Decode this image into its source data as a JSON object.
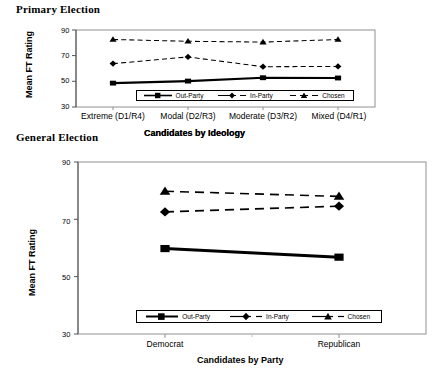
{
  "figure": {
    "panels": [
      {
        "id": "primary",
        "title": "Primary Election",
        "ylabel": "Mean FT Rating",
        "xlabel": "Candidates by Ideology"
      },
      {
        "id": "general",
        "title": "General Election",
        "ylabel": "Mean FT Rating",
        "xlabel": "Candidates by Party"
      }
    ],
    "legend": {
      "entries": [
        {
          "label": "Out-Party",
          "marker": "square",
          "line": "solid"
        },
        {
          "label": "In-Party",
          "marker": "diamond",
          "line": "dash-dot"
        },
        {
          "label": "Chosen",
          "marker": "triangle",
          "line": "dash-dot"
        }
      ]
    },
    "colors": {
      "line": "#000000",
      "frame": "#808080",
      "background": "#ffffff"
    }
  },
  "chart_data": [
    {
      "type": "line",
      "title": "Primary Election",
      "xlabel": "Candidates by Ideology",
      "ylabel": "Mean FT Rating",
      "categories": [
        "Extreme (D1/R4)",
        "Modal (D2/R3)",
        "Moderate (D3/R2)",
        "Mixed (D4/R1)"
      ],
      "ylim": [
        30,
        90
      ],
      "yticks": [
        30,
        50,
        70,
        90
      ],
      "grid": false,
      "legend_position": "inside-bottom-center",
      "series": [
        {
          "name": "Out-Party",
          "marker": "square",
          "line": "solid",
          "values": [
            48.6,
            50.2,
            52.8,
            52.6
          ]
        },
        {
          "name": "In-Party",
          "marker": "diamond",
          "line": "dash-dot",
          "values": [
            63.8,
            69.0,
            61.4,
            61.6
          ]
        },
        {
          "name": "Chosen",
          "marker": "triangle",
          "line": "dash-dot",
          "values": [
            82.6,
            81.2,
            80.6,
            82.6
          ]
        }
      ]
    },
    {
      "type": "line",
      "title": "General Election",
      "xlabel": "Candidates by Party",
      "ylabel": "Mean FT Rating",
      "categories": [
        "Democrat",
        "Republican"
      ],
      "ylim": [
        30,
        90
      ],
      "yticks": [
        30,
        50,
        70,
        90
      ],
      "grid": false,
      "legend_position": "inside-bottom-center",
      "series": [
        {
          "name": "Out-Party",
          "marker": "square",
          "line": "solid",
          "values": [
            59.8,
            56.8
          ]
        },
        {
          "name": "In-Party",
          "marker": "diamond",
          "line": "dash-dot",
          "values": [
            72.6,
            74.6
          ]
        },
        {
          "name": "Chosen",
          "marker": "triangle",
          "line": "dash-dot",
          "values": [
            79.8,
            78.0
          ]
        }
      ]
    }
  ]
}
